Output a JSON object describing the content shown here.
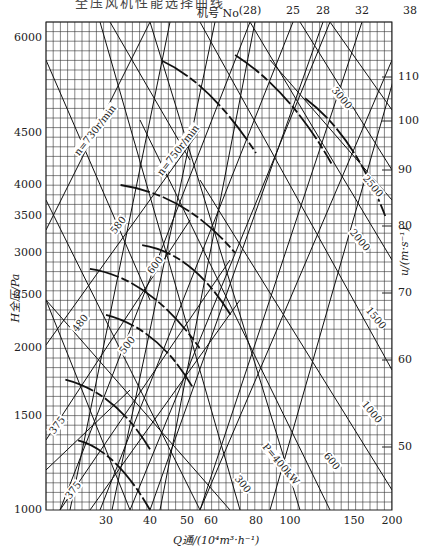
{
  "title_cutoff": "全压风机性能选择曲线",
  "top_axis": {
    "label": "机号 No",
    "labels": [
      {
        "text": "(28)",
        "x": 250
      },
      {
        "text": "25",
        "x": 293
      },
      {
        "text": "28",
        "x": 323
      },
      {
        "text": "32",
        "x": 362
      },
      {
        "text": "38",
        "x": 410
      }
    ]
  },
  "y_axis": {
    "label": "H全压/Pa",
    "ticks": [
      {
        "text": "6000",
        "y": 38
      },
      {
        "text": "4500",
        "y": 133
      },
      {
        "text": "4000",
        "y": 185
      },
      {
        "text": "3500",
        "y": 216
      },
      {
        "text": "3000",
        "y": 253
      },
      {
        "text": "2500",
        "y": 295
      },
      {
        "text": "2000",
        "y": 348
      },
      {
        "text": "1500",
        "y": 416
      },
      {
        "text": "1000",
        "y": 510
      }
    ]
  },
  "right_axis": {
    "label": "u/(m·s⁻¹)",
    "ticks": [
      {
        "text": "110",
        "y": 77
      },
      {
        "text": "100",
        "y": 121
      },
      {
        "text": "90",
        "y": 170
      },
      {
        "text": "80",
        "y": 226
      },
      {
        "text": "70",
        "y": 293
      },
      {
        "text": "60",
        "y": 360
      },
      {
        "text": "50",
        "y": 447
      }
    ]
  },
  "x_axis": {
    "label": "Q通/(10⁴m³·h⁻¹)",
    "ticks": [
      {
        "text": "30",
        "x": 106
      },
      {
        "text": "40",
        "x": 150
      },
      {
        "text": "50",
        "x": 187
      },
      {
        "text": "60",
        "x": 211
      },
      {
        "text": "80",
        "x": 256
      },
      {
        "text": "100",
        "x": 290
      },
      {
        "text": "150",
        "x": 354
      },
      {
        "text": "200",
        "x": 392
      }
    ]
  },
  "line_labels": [
    {
      "text": "n=730r/min",
      "x": 95,
      "y": 130,
      "rot": -52
    },
    {
      "text": "n=750r/min",
      "x": 178,
      "y": 150,
      "rot": -52
    },
    {
      "text": "580",
      "x": 118,
      "y": 225,
      "rot": -52
    },
    {
      "text": "600",
      "x": 155,
      "y": 265,
      "rot": -52
    },
    {
      "text": "480",
      "x": 80,
      "y": 323,
      "rot": -52
    },
    {
      "text": "500",
      "x": 127,
      "y": 345,
      "rot": -52
    },
    {
      "text": "375",
      "x": 57,
      "y": 425,
      "rot": -52
    },
    {
      "text": "375",
      "x": 73,
      "y": 490,
      "rot": -52
    },
    {
      "text": "3000",
      "x": 342,
      "y": 98,
      "rot": 50
    },
    {
      "text": "2500",
      "x": 373,
      "y": 186,
      "rot": 50
    },
    {
      "text": "2000",
      "x": 360,
      "y": 240,
      "rot": 50
    },
    {
      "text": "1500",
      "x": 376,
      "y": 318,
      "rot": 50
    },
    {
      "text": "1000",
      "x": 372,
      "y": 412,
      "rot": 50
    },
    {
      "text": "600",
      "x": 332,
      "y": 461,
      "rot": 50
    },
    {
      "text": "P=400kW",
      "x": 281,
      "y": 464,
      "rot": 50
    },
    {
      "text": "300",
      "x": 243,
      "y": 484,
      "rot": 50
    }
  ],
  "chart_data": {
    "type": "line",
    "xlabel": "Q通/(10⁴m³·h⁻¹)",
    "ylabel": "H全压/Pa",
    "y2label": "u/(m·s⁻¹)",
    "xscale": "log",
    "yscale": "log",
    "xlim": [
      20,
      200
    ],
    "ylim": [
      1000,
      6500
    ],
    "x_ticks": [
      30,
      40,
      50,
      60,
      80,
      100,
      150,
      200
    ],
    "y_ticks": [
      1000,
      1500,
      2000,
      2500,
      3000,
      3500,
      4000,
      4500,
      6000
    ],
    "y2_ticks": [
      50,
      60,
      70,
      80,
      90,
      100,
      110
    ],
    "top_ticks_machine_no": [
      "(28)",
      "25",
      "28",
      "32",
      "38"
    ],
    "speed_lines_r_per_min": [
      730,
      750,
      580,
      600,
      480,
      500,
      375,
      375
    ],
    "power_lines_kW": [
      300,
      400,
      600,
      1000,
      1500,
      2000,
      2500,
      3000
    ],
    "grid": true,
    "series": [
      {
        "name": "No.25 @ 730r/min",
        "points": [
          [
            43,
            5600
          ],
          [
            60,
            5100
          ],
          [
            80,
            4300
          ]
        ]
      },
      {
        "name": "No.28 @ 580r/min",
        "points": [
          [
            33,
            4000
          ],
          [
            50,
            3700
          ],
          [
            70,
            3000
          ]
        ]
      },
      {
        "name": "No.25 @ 600r/min",
        "points": [
          [
            38,
            3100
          ],
          [
            52,
            2900
          ],
          [
            68,
            2300
          ]
        ]
      },
      {
        "name": "No.28 @ 480r/min",
        "points": [
          [
            27,
            2800
          ],
          [
            40,
            2600
          ],
          [
            55,
            2000
          ]
        ]
      },
      {
        "name": "No.25 @ 500r/min",
        "points": [
          [
            30,
            2300
          ],
          [
            42,
            2100
          ],
          [
            52,
            1700
          ]
        ]
      },
      {
        "name": "No.28 @ 375r/min",
        "points": [
          [
            23,
            1750
          ],
          [
            32,
            1600
          ],
          [
            40,
            1300
          ]
        ]
      },
      {
        "name": "No.25 @ 375r/min",
        "points": [
          [
            25,
            1350
          ],
          [
            32,
            1250
          ],
          [
            40,
            1000
          ]
        ]
      },
      {
        "name": "No.32",
        "points": [
          [
            70,
            5700
          ],
          [
            100,
            5000
          ],
          [
            130,
            4200
          ]
        ]
      },
      {
        "name": "No.38",
        "points": [
          [
            110,
            5000
          ],
          [
            150,
            4400
          ],
          [
            190,
            3500
          ]
        ]
      }
    ]
  }
}
